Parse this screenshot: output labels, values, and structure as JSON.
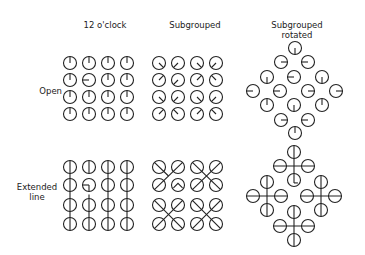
{
  "figure": {
    "column_headers": [
      "12 o'clock",
      "Subgrouped",
      "Subgrouped\nrotated"
    ],
    "column_header_lines": {
      "col1": "12 o'clock",
      "col2": "Subgrouped",
      "col3_line1": "Subgrouped",
      "col3_line2": "rotated"
    },
    "row_labels": {
      "row1": "Open",
      "row2_line1": "Extended",
      "row2_line2": "line"
    },
    "stroke_color": "#222222",
    "background": "#ffffff",
    "circle_radius": 6.5
  },
  "panels": {
    "open_12oclock": {
      "description": "4x4 grid of circles, each with a radius line; all point N except one odd target",
      "xs": [
        70,
        89,
        108,
        127
      ],
      "ys": [
        63,
        80,
        97,
        114
      ],
      "directions": [
        [
          "N",
          "N",
          "N",
          "N"
        ],
        [
          "N",
          "W",
          "N",
          "N"
        ],
        [
          "N",
          "N",
          "N",
          "N"
        ],
        [
          "N",
          "N",
          "N",
          "N"
        ]
      ]
    },
    "open_subgrouped": {
      "description": "4x4 grid; radius lines point toward the center of each 2x2 subgroup; one odd target",
      "xs": [
        159,
        178,
        197,
        216
      ],
      "ys": [
        63,
        80,
        97,
        114
      ],
      "directions": [
        [
          "SE",
          "SW",
          "SE",
          "SW"
        ],
        [
          "NE",
          "SW",
          "NE",
          "NW"
        ],
        [
          "SE",
          "SW",
          "SE",
          "SW"
        ],
        [
          "NE",
          "NW",
          "NE",
          "NW"
        ]
      ]
    },
    "open_subgrouped_rotated": {
      "description": "Diamond of 16 circles (rows of 1,2,3,4,3,2,1)",
      "circles": [
        {
          "x": 295,
          "y": 48,
          "dir": "S"
        },
        {
          "x": 281,
          "y": 62,
          "dir": "E"
        },
        {
          "x": 308,
          "y": 62,
          "dir": "W"
        },
        {
          "x": 267,
          "y": 77,
          "dir": "S"
        },
        {
          "x": 294,
          "y": 77,
          "dir": "W"
        },
        {
          "x": 322,
          "y": 77,
          "dir": "S"
        },
        {
          "x": 253,
          "y": 91,
          "dir": "W"
        },
        {
          "x": 280,
          "y": 91,
          "dir": "W"
        },
        {
          "x": 308,
          "y": 91,
          "dir": "E"
        },
        {
          "x": 336,
          "y": 91,
          "dir": "E"
        },
        {
          "x": 267,
          "y": 105,
          "dir": "N"
        },
        {
          "x": 294,
          "y": 105,
          "dir": "S"
        },
        {
          "x": 322,
          "y": 105,
          "dir": "N"
        },
        {
          "x": 281,
          "y": 120,
          "dir": "E"
        },
        {
          "x": 308,
          "y": 120,
          "dir": "W"
        },
        {
          "x": 295,
          "y": 133,
          "dir": "N"
        }
      ]
    },
    "extended_12oclock": {
      "description": "4x4 grid; vertical lines run through each column; one odd target with a short radius line",
      "xs": [
        70,
        89,
        108,
        127
      ],
      "ys": [
        167,
        185,
        205,
        224
      ],
      "odd": {
        "row": 1,
        "col": 1,
        "dir": "W"
      }
    },
    "extended_subgrouped": {
      "description": "Four 2x2 subgroups; diagonal lines cross at each subgroup center forming an X; one odd target with a chevron",
      "xs": [
        159,
        178,
        197,
        216
      ],
      "ys": [
        167,
        185,
        205,
        224
      ],
      "odd": {
        "row": 1,
        "col": 1,
        "shape": "chevron"
      }
    },
    "extended_subgrouped_rotated": {
      "description": "Four plus-shaped crosses of 4 circles arranged in a diamond; one odd target",
      "crosses": [
        {
          "cx": 294,
          "cy": 166,
          "odd_bottom": true
        },
        {
          "cx": 267,
          "cy": 196,
          "odd_bottom": false
        },
        {
          "cx": 321,
          "cy": 196,
          "odd_bottom": false
        },
        {
          "cx": 294,
          "cy": 226,
          "odd_bottom": false
        }
      ],
      "arm": 14
    }
  }
}
